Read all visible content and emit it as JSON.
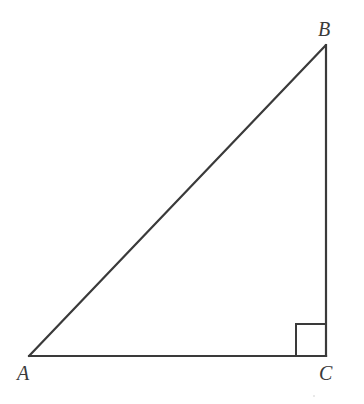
{
  "diagram": {
    "type": "right-triangle",
    "vertices": {
      "A": {
        "label": "A",
        "x": 29,
        "y": 356
      },
      "B": {
        "label": "B",
        "x": 326,
        "y": 45
      },
      "C": {
        "label": "C",
        "x": 326,
        "y": 356
      }
    },
    "right_angle_at": "C",
    "right_angle_marker_size": 30,
    "stroke_color": "#3a3a3a",
    "label_color": "#3a3a3a"
  },
  "labels": {
    "A": "A",
    "B": "B",
    "C": "C"
  }
}
